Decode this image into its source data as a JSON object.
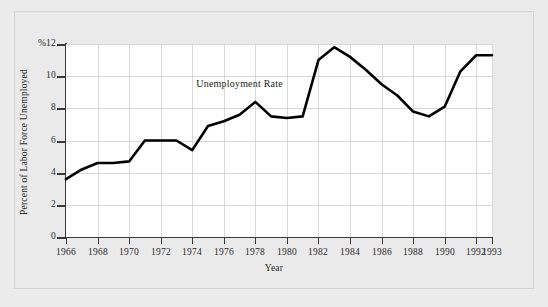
{
  "figure": {
    "background_color": "#ebebeb",
    "frame_border_color": "#d3d3d3",
    "plot_background_color": "#ffffff",
    "grid_color": "#d8d8d8",
    "axis_color": "#3a3a3a",
    "line_color": "#000000"
  },
  "chart_data": {
    "type": "line",
    "title": "",
    "xlabel": "Year",
    "ylabel": "Percent of Labor Force Unemployed",
    "y_axis_top_label": "%12",
    "xlim": [
      1966,
      1993
    ],
    "ylim": [
      0,
      12
    ],
    "grid": true,
    "legend": "none",
    "annotations": [
      {
        "text": "Unemployment Rate",
        "x": 1977.0,
        "y": 9.45
      }
    ],
    "y_ticks": [
      0,
      2,
      4,
      6,
      8,
      10,
      12
    ],
    "y_tick_labels": [
      "0",
      "2",
      "4",
      "6",
      "8",
      "10",
      "%12"
    ],
    "x_ticks": [
      1966,
      1968,
      1970,
      1972,
      1974,
      1976,
      1978,
      1980,
      1982,
      1984,
      1986,
      1988,
      1990,
      1992,
      1993
    ],
    "x_tick_labels": [
      "1966",
      "1968",
      "1970",
      "1972",
      "1974",
      "1976",
      "1978",
      "1980",
      "1982",
      "1984",
      "1986",
      "1988",
      "1990",
      "1992",
      "1993"
    ],
    "series": [
      {
        "name": "Unemployment Rate",
        "x": [
          1966,
          1967,
          1968,
          1969,
          1970,
          1971,
          1972,
          1973,
          1974,
          1975,
          1976,
          1977,
          1978,
          1979,
          1980,
          1981,
          1982,
          1983,
          1984,
          1985,
          1986,
          1987,
          1988,
          1989,
          1990,
          1991,
          1992,
          1993
        ],
        "values": [
          3.6,
          4.2,
          4.6,
          4.6,
          4.7,
          6.0,
          6.0,
          6.0,
          5.4,
          6.9,
          7.2,
          7.6,
          8.4,
          7.5,
          7.4,
          7.5,
          11.0,
          11.8,
          11.2,
          10.4,
          9.5,
          8.8,
          7.8,
          7.5,
          8.1,
          10.3,
          11.3,
          11.3
        ]
      }
    ]
  }
}
